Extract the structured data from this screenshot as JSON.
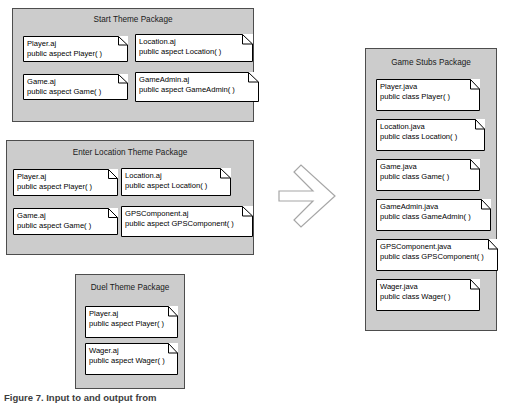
{
  "diagram": {
    "arrow": {
      "name": "transformation-arrow",
      "direction": "right",
      "fill": "#ffffff",
      "stroke": "#999999"
    },
    "colors": {
      "package_fill": "#cccccc",
      "package_border": "#4d4d4d",
      "note_fill": "#ffffff",
      "note_border": "#000000",
      "page_background": "#ffffff"
    },
    "caption": "Figure 7. Input to and output from",
    "packages": [
      {
        "id": "start-theme-package",
        "title": "Start Theme Package",
        "notes": [
          {
            "file": "Player.aj",
            "declaration": "public aspect Player( )"
          },
          {
            "file": "Location.aj",
            "declaration": "public aspect Location( )"
          },
          {
            "file": "Game.aj",
            "declaration": "public aspect Game( )"
          },
          {
            "file": "GameAdmin.aj",
            "declaration": "public aspect GameAdmin( )"
          }
        ]
      },
      {
        "id": "enter-location-theme-package",
        "title": "Enter Location Theme Package",
        "notes": [
          {
            "file": "Player.aj",
            "declaration": "public aspect Player( )"
          },
          {
            "file": "Location.aj",
            "declaration": "public aspect Location( )"
          },
          {
            "file": "Game.aj",
            "declaration": "public aspect Game( )"
          },
          {
            "file": "GPSComponent.aj",
            "declaration": "public aspect GPSComponent( )"
          }
        ]
      },
      {
        "id": "duel-theme-package",
        "title": "Duel Theme Package",
        "notes": [
          {
            "file": "Player.aj",
            "declaration": "public aspect Player( )"
          },
          {
            "file": "Wager.aj",
            "declaration": "public aspect Wager( )"
          }
        ]
      },
      {
        "id": "game-stubs-package",
        "title": "Game Stubs Package",
        "notes": [
          {
            "file": "Player.java",
            "declaration": "public class Player( )"
          },
          {
            "file": "Location.java",
            "declaration": "public class Location( )"
          },
          {
            "file": "Game.java",
            "declaration": "public class Game( )"
          },
          {
            "file": "GameAdmin.java",
            "declaration": "public class GameAdmin( )"
          },
          {
            "file": "GPSComponent.java",
            "declaration": "public class GPSComponent( )"
          },
          {
            "file": "Wager.java",
            "declaration": "public class Wager( )"
          }
        ]
      }
    ]
  }
}
